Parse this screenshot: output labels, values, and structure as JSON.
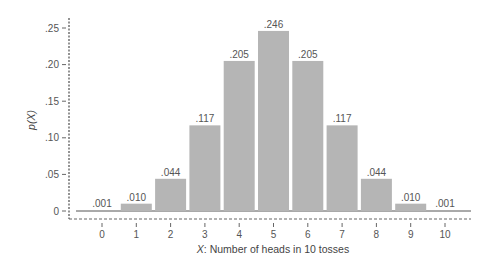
{
  "chart_data": {
    "type": "bar",
    "title": "",
    "xlabel_var": "X",
    "xlabel_rest": ": Number of heads in 10 tosses",
    "ylabel": "p(X)",
    "categories": [
      "0",
      "1",
      "2",
      "3",
      "4",
      "5",
      "6",
      "7",
      "8",
      "9",
      "10"
    ],
    "values": [
      0.001,
      0.01,
      0.044,
      0.117,
      0.205,
      0.246,
      0.205,
      0.117,
      0.044,
      0.01,
      0.001
    ],
    "value_labels": [
      ".001",
      ".010",
      ".044",
      ".117",
      ".205",
      ".246",
      ".205",
      ".117",
      ".044",
      ".010",
      ".001"
    ],
    "yticks": [
      0,
      0.05,
      0.1,
      0.15,
      0.2,
      0.25
    ],
    "ytick_labels": [
      "0",
      ".05",
      ".10",
      ".15",
      ".20",
      ".25"
    ],
    "ylim": [
      0,
      0.26
    ],
    "grid": false,
    "legend": null,
    "bar_color": "#b5b5b5",
    "axis_color": "#666666"
  }
}
